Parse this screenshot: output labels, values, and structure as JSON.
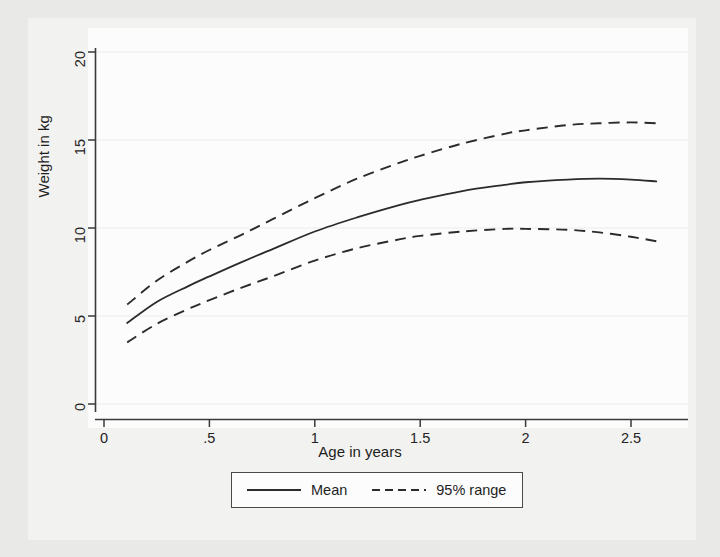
{
  "chart_data": {
    "type": "line",
    "title": "",
    "xlabel": "Age in years",
    "ylabel": "Weight in kg",
    "xlim": [
      0,
      2.75
    ],
    "ylim": [
      0,
      20
    ],
    "xticks": [
      "0",
      ".5",
      "1",
      "1.5",
      "2",
      "2.5"
    ],
    "xtick_values": [
      0,
      0.5,
      1,
      1.5,
      2,
      2.5
    ],
    "yticks": [
      "0",
      "5",
      "10",
      "15",
      "20"
    ],
    "ytick_values": [
      0,
      5,
      10,
      15,
      20
    ],
    "grid": true,
    "legend_position": "below",
    "x": [
      0.11,
      0.25,
      0.4,
      0.5,
      0.65,
      0.8,
      1.0,
      1.2,
      1.4,
      1.5,
      1.7,
      1.9,
      2.0,
      2.2,
      2.35,
      2.5,
      2.62
    ],
    "series": [
      {
        "name": "Mean",
        "style": "solid",
        "values": [
          4.6,
          5.8,
          6.7,
          7.25,
          8.05,
          8.8,
          9.8,
          10.6,
          11.3,
          11.6,
          12.1,
          12.45,
          12.6,
          12.75,
          12.8,
          12.75,
          12.65
        ]
      },
      {
        "name": "95% range upper",
        "style": "dashed",
        "values": [
          5.65,
          7.0,
          8.1,
          8.75,
          9.6,
          10.5,
          11.7,
          12.8,
          13.7,
          14.1,
          14.8,
          15.35,
          15.55,
          15.85,
          15.95,
          16.0,
          15.95
        ]
      },
      {
        "name": "95% range lower",
        "style": "dashed",
        "values": [
          3.5,
          4.55,
          5.4,
          5.9,
          6.6,
          7.25,
          8.15,
          8.85,
          9.35,
          9.55,
          9.8,
          9.95,
          9.95,
          9.9,
          9.75,
          9.5,
          9.25
        ]
      }
    ],
    "legend": [
      {
        "label": "Mean",
        "style": "solid"
      },
      {
        "label": "95% range",
        "style": "dashed"
      }
    ],
    "colors": {
      "line": "#2b2b2b",
      "axis": "#3a3a3a",
      "grid": "#ececec",
      "plot_background": "#fcfcfc",
      "page_background": "#e9e9e7"
    }
  }
}
